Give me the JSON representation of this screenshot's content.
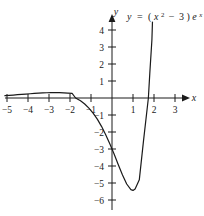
{
  "chart_data": {
    "type": "line",
    "title": "",
    "equation_label": "y = (x² − 3)eˣ",
    "equation_parts": {
      "lhs": "y",
      "equals": "=",
      "open": "(",
      "base": "x",
      "exponent": "2",
      "minus": "−",
      "constant": "3",
      "close": ")",
      "e": "e",
      "e_exponent": "x"
    },
    "xlabel": "x",
    "ylabel": "y",
    "xlim": [
      -5.1,
      3.5
    ],
    "ylim": [
      -6.4,
      4.6
    ],
    "grid": false,
    "legend": false,
    "x_ticks": [
      -5,
      -4,
      -3,
      -2,
      -1,
      1,
      2,
      3
    ],
    "x_tick_labels": [
      "−5",
      "−4",
      "−3",
      "−2",
      "−1",
      "1",
      "2",
      "3"
    ],
    "y_ticks": [
      -6,
      -5,
      -4,
      -3,
      -2,
      -1,
      1,
      2,
      3,
      4
    ],
    "y_tick_labels": [
      "−6",
      "−5",
      "−4",
      "−3",
      "−2",
      "−1",
      "1",
      "2",
      "3",
      "4"
    ],
    "series": [
      {
        "name": "y = (x^2 - 3)e^x",
        "color": "#1a1a1a",
        "x": [
          -5.1,
          -4.9,
          -4.7,
          -4.5,
          -4.3,
          -4.1,
          -3.9,
          -3.7,
          -3.5,
          -3.3,
          -3.1,
          -2.9,
          -2.7,
          -2.5,
          -2.3,
          -2.1,
          -1.9,
          -1.732,
          -1.5,
          -1.3,
          -1.1,
          -0.9,
          -0.7,
          -0.5,
          -0.3,
          -0.1,
          0,
          0.1,
          0.3,
          0.5,
          0.7,
          0.9,
          1,
          1.1,
          1.3,
          1.5,
          1.732,
          1.8,
          1.9,
          2.0,
          2.05
        ],
        "y": [
          0.137,
          0.155,
          0.174,
          0.193,
          0.213,
          0.232,
          0.25,
          0.268,
          0.284,
          0.298,
          0.309,
          0.316,
          0.318,
          0.315,
          0.306,
          0.29,
          0.268,
          0.0,
          -0.167,
          -0.355,
          -0.595,
          -0.89,
          -1.243,
          -1.667,
          -2.156,
          -2.71,
          -3.0,
          -3.3,
          -3.926,
          -4.534,
          -5.059,
          -5.39,
          -5.437,
          -5.348,
          -4.813,
          -2.52,
          0.0,
          1.45,
          3.41,
          7.39,
          9.65
        ],
        "key_points": {
          "zeros": [
            -1.732,
            1.732
          ],
          "local_max": {
            "x": -2.732,
            "y": 0.318
          },
          "local_min": {
            "x": 1.0,
            "y": -5.44
          },
          "y_intercept": -3.0
        }
      }
    ]
  },
  "axes_pixels": {
    "origin_x": 112,
    "origin_y": 98,
    "unit_x": 21,
    "unit_y": 17
  }
}
